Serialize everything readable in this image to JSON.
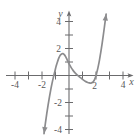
{
  "chart_data": {
    "type": "line",
    "title": "",
    "subtitle": "",
    "xlabel": "x",
    "ylabel": "y",
    "xlim": [
      -4.9,
      4.6
    ],
    "ylim": [
      -4.7,
      4.8
    ],
    "grid": false,
    "legend": null,
    "axis_color": "#6b6b6d",
    "curve_color": "#8c8c8e",
    "text_color": "#58585a",
    "background": "#ffffff",
    "x_ticks": [
      -4,
      -3,
      -2,
      -1,
      1,
      2,
      3,
      4
    ],
    "x_tick_labels": [
      "-4",
      "",
      "-2",
      "",
      "",
      "2",
      "",
      "4"
    ],
    "y_ticks": [
      -4,
      -3,
      -2,
      -1,
      1,
      2,
      3,
      4
    ],
    "y_tick_labels": [
      "-4",
      "",
      "-2",
      "",
      "",
      "2",
      "",
      "4"
    ],
    "x_axis_arrow": true,
    "y_axis_arrow": true,
    "curve_arrow_start": true,
    "curve_arrow_end": true,
    "series": [
      {
        "name": "cubic-curve",
        "points": [
          [
            -1.85,
            -4.3
          ],
          [
            -1.75,
            -3.55
          ],
          [
            -1.65,
            -2.85
          ],
          [
            -1.55,
            -2.2
          ],
          [
            -1.45,
            -1.6
          ],
          [
            -1.35,
            -1.05
          ],
          [
            -1.25,
            -0.55
          ],
          [
            -1.15,
            -0.1
          ],
          [
            -1.05,
            0.3
          ],
          [
            -0.95,
            0.7
          ],
          [
            -0.85,
            1.02
          ],
          [
            -0.75,
            1.3
          ],
          [
            -0.65,
            1.5
          ],
          [
            -0.55,
            1.6
          ],
          [
            -0.45,
            1.62
          ],
          [
            -0.35,
            1.55
          ],
          [
            -0.25,
            1.4
          ],
          [
            -0.15,
            1.2
          ],
          [
            -0.05,
            0.98
          ],
          [
            0.05,
            0.78
          ],
          [
            0.15,
            0.6
          ],
          [
            0.3,
            0.38
          ],
          [
            0.45,
            0.2
          ],
          [
            0.6,
            0.05
          ],
          [
            0.75,
            -0.08
          ],
          [
            0.9,
            -0.2
          ],
          [
            1.05,
            -0.32
          ],
          [
            1.2,
            -0.42
          ],
          [
            1.35,
            -0.5
          ],
          [
            1.5,
            -0.55
          ],
          [
            1.62,
            -0.56
          ],
          [
            1.72,
            -0.52
          ],
          [
            1.82,
            -0.42
          ],
          [
            1.9,
            -0.28
          ],
          [
            1.98,
            -0.08
          ],
          [
            2.05,
            0.18
          ],
          [
            2.15,
            0.6
          ],
          [
            2.25,
            1.1
          ],
          [
            2.35,
            1.7
          ],
          [
            2.45,
            2.35
          ],
          [
            2.55,
            3.05
          ],
          [
            2.65,
            3.8
          ],
          [
            2.75,
            4.55
          ]
        ],
        "features": {
          "local_max": [
            -0.5,
            1.62
          ],
          "local_min": [
            1.65,
            -0.56
          ],
          "x_intercepts": [
            -1.17,
            0.68,
            2.0
          ]
        }
      }
    ]
  }
}
